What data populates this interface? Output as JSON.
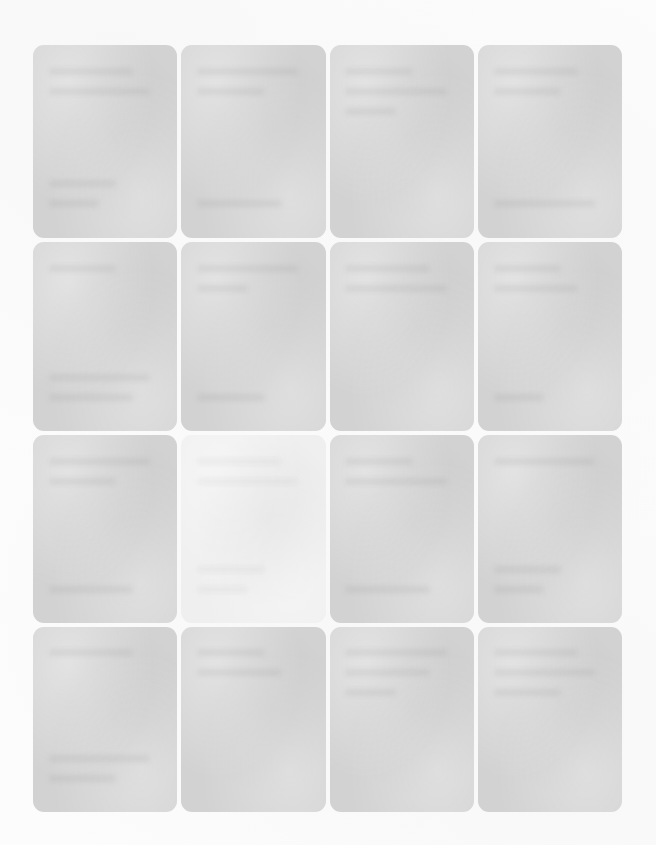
{
  "page": {
    "title": "",
    "background_color": "#fcfcfc",
    "width": 656,
    "height": 845,
    "appearance_note": "Heavily blurred / faded screenshot; no text is legible."
  },
  "grid": {
    "columns": 4,
    "rows": 4,
    "left": 33,
    "top": 45,
    "width": 589,
    "height": 755,
    "gutter": 4,
    "card_radius": 11,
    "card_color": "#d2d2d2",
    "card_highlight_color": "#efefef"
  },
  "cards": [
    {
      "id": "card-r1c1",
      "row": 1,
      "col": 1,
      "state": "default",
      "label": "",
      "color": "#d2d2d2"
    },
    {
      "id": "card-r1c2",
      "row": 1,
      "col": 2,
      "state": "default",
      "label": "",
      "color": "#d2d2d2"
    },
    {
      "id": "card-r1c3",
      "row": 1,
      "col": 3,
      "state": "default",
      "label": "",
      "color": "#d2d2d2"
    },
    {
      "id": "card-r1c4",
      "row": 1,
      "col": 4,
      "state": "default",
      "label": "",
      "color": "#d2d2d2"
    },
    {
      "id": "card-r2c1",
      "row": 2,
      "col": 1,
      "state": "default",
      "label": "",
      "color": "#d2d2d2"
    },
    {
      "id": "card-r2c2",
      "row": 2,
      "col": 2,
      "state": "default",
      "label": "",
      "color": "#d2d2d2"
    },
    {
      "id": "card-r2c3",
      "row": 2,
      "col": 3,
      "state": "default",
      "label": "",
      "color": "#d2d2d2"
    },
    {
      "id": "card-r2c4",
      "row": 2,
      "col": 4,
      "state": "default",
      "label": "",
      "color": "#d2d2d2"
    },
    {
      "id": "card-r3c1",
      "row": 3,
      "col": 1,
      "state": "default",
      "label": "",
      "color": "#d2d2d2"
    },
    {
      "id": "card-r3c2",
      "row": 3,
      "col": 2,
      "state": "highlighted",
      "label": "",
      "color": "#efefef"
    },
    {
      "id": "card-r3c3",
      "row": 3,
      "col": 3,
      "state": "default",
      "label": "",
      "color": "#d2d2d2"
    },
    {
      "id": "card-r3c4",
      "row": 3,
      "col": 4,
      "state": "default",
      "label": "",
      "color": "#d2d2d2"
    },
    {
      "id": "card-r4c1",
      "row": 4,
      "col": 1,
      "state": "default",
      "label": "",
      "color": "#d2d2d2"
    },
    {
      "id": "card-r4c2",
      "row": 4,
      "col": 2,
      "state": "default",
      "label": "",
      "color": "#d2d2d2"
    },
    {
      "id": "card-r4c3",
      "row": 4,
      "col": 3,
      "state": "default",
      "label": "",
      "color": "#d2d2d2"
    },
    {
      "id": "card-r4c4",
      "row": 4,
      "col": 4,
      "state": "default",
      "label": "",
      "color": "#d2d2d2"
    }
  ]
}
